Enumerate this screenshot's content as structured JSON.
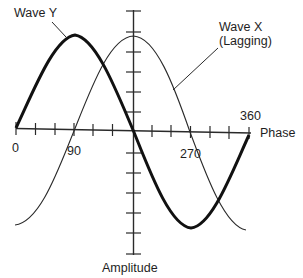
{
  "diagram": {
    "labels": {
      "wave_y": "Wave Y",
      "wave_x_line1": "Wave X",
      "wave_x_line2": "(Lagging)",
      "x_axis": "Phase",
      "y_axis": "Amplitude",
      "tick_0": "0",
      "tick_90": "90",
      "tick_270": "270",
      "tick_360": "360"
    },
    "colors": {
      "ink": "#1a1a1a",
      "background": "#ffffff"
    },
    "waves": [
      {
        "name": "Wave Y",
        "style": "thick",
        "phase_shift_deg": 0,
        "description": "sine starting at 0, peak at 90, zero at 180, trough at 270"
      },
      {
        "name": "Wave X",
        "style": "thin",
        "phase_shift_deg": -90,
        "description": "lags Wave Y by 90 degrees; trough at 0, zero at 90, peak at 180, zero at 270"
      }
    ],
    "x_axis_ticks_deg": [
      0,
      30,
      60,
      90,
      120,
      150,
      180,
      210,
      240,
      270,
      300,
      330,
      360
    ],
    "y_axis_tick_count": 12
  }
}
